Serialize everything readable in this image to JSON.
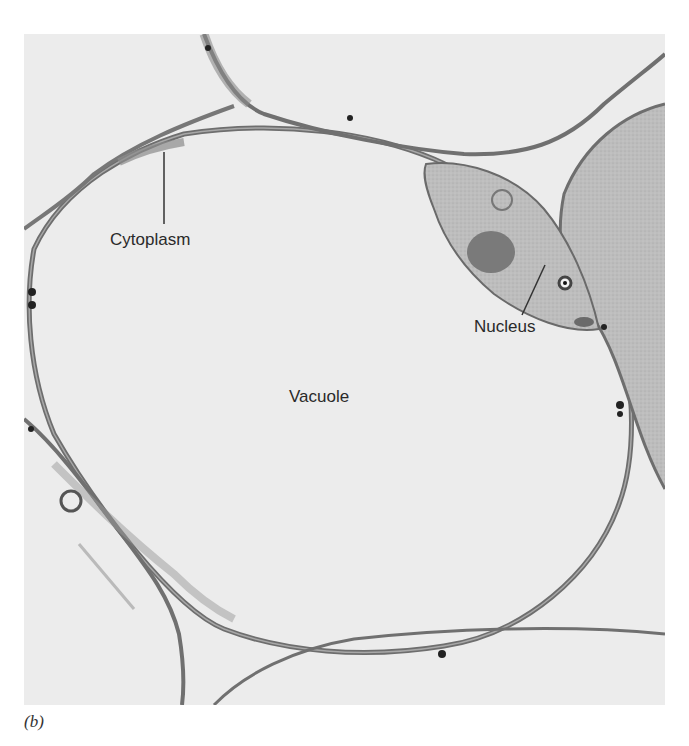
{
  "figure": {
    "panel_caption": "(b)",
    "labels": {
      "cytoplasm": "Cytoplasm",
      "nucleus": "Nucleus",
      "vacuole": "Vacuole"
    },
    "colors": {
      "background": "#ececec",
      "membrane": "#6e6e6e",
      "cytoplasm_fill": "#b9b9b9",
      "nucleolus": "#7a7a7a",
      "granule": "#222222"
    }
  }
}
